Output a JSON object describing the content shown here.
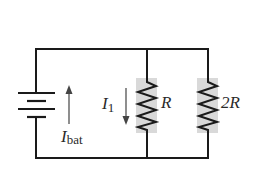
{
  "diagram": {
    "type": "circuit",
    "colors": {
      "wire": "#1a1a1a",
      "resistor_shade": "#d9d9d9",
      "arrow": "#444444",
      "text": "#2a2a2a"
    },
    "battery": {
      "label_main": "I",
      "label_sub": "bat",
      "current_direction": "up"
    },
    "branch_current": {
      "label_main": "I",
      "label_sub": "1",
      "current_direction": "down"
    },
    "resistors": [
      {
        "label": "R"
      },
      {
        "label": "2R"
      }
    ]
  }
}
